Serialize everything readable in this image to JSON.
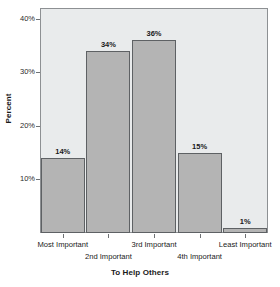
{
  "chart_data": {
    "type": "bar",
    "title": "",
    "xlabel": "To Help Others",
    "ylabel": "Percent",
    "categories": [
      "Most Important",
      "2nd Important",
      "3rd Important",
      "4th Important",
      "Least Important"
    ],
    "values": [
      14,
      34,
      36,
      15,
      1
    ],
    "data_labels": [
      "14%",
      "34%",
      "36%",
      "15%",
      "1%"
    ],
    "ylim": [
      0,
      42
    ],
    "yticks": [
      10,
      20,
      30,
      40
    ],
    "ytick_labels": [
      "10%",
      "20%",
      "30%",
      "40%"
    ],
    "grid": false,
    "legend": null,
    "colors": {
      "bar_fill": "#b4b4b4",
      "bar_border": "#5e6164",
      "plot_background": "#e9ebec",
      "frame": "#8d9093",
      "text": "#1a1a1a",
      "figure_background": "#ffffff"
    }
  }
}
